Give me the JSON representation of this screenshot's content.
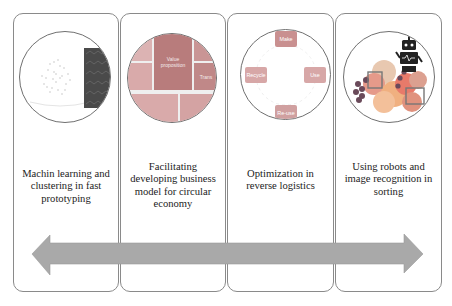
{
  "panels": [
    {
      "caption": "Machin learning and clustering in fast prototyping",
      "image": "clustering-scatter-image"
    },
    {
      "caption": "Facilitating developing business model for circular economy",
      "image": "business-model-canvas-image",
      "canvas_labels": {
        "center": "Value proposition",
        "right": "Trans"
      }
    },
    {
      "caption": "Optimization in reverse logistics",
      "image": "circular-cycle-image",
      "cycle_nodes": [
        "Make",
        "Use",
        "Re-use",
        "Recycle"
      ]
    },
    {
      "caption": "Using robots and image recognition in sorting",
      "image": "robot-fruit-recognition-image"
    }
  ],
  "arrow": {
    "type": "double-headed",
    "color": "#a9a9a9"
  },
  "colors": {
    "panel_border": "#8a8a8a",
    "canvas_center": "#b87c7c",
    "canvas_tile": "#d9aaaa",
    "cycle_node": "#d7a7a7"
  }
}
